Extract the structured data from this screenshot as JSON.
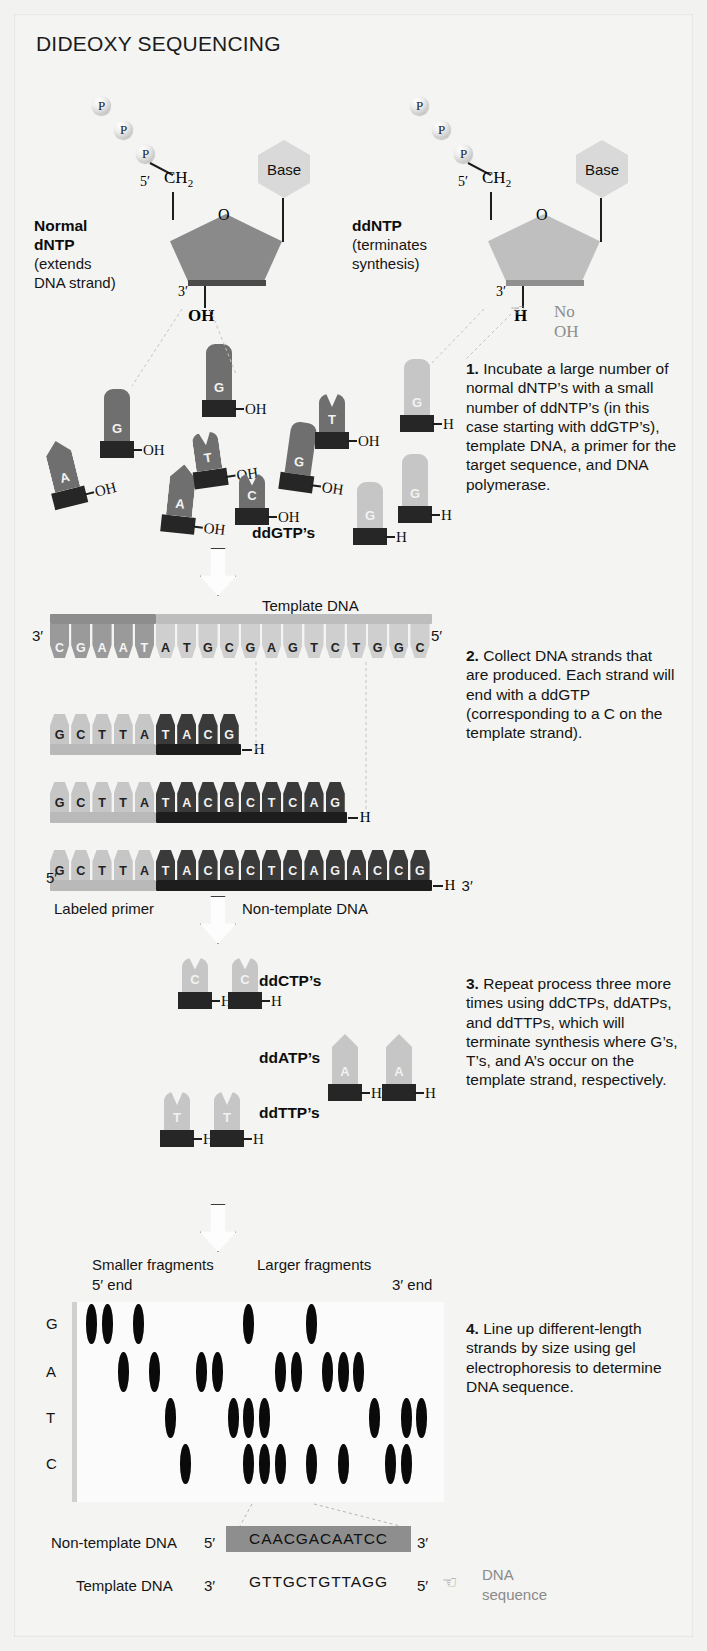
{
  "title": "DIDEOXY SEQUENCING",
  "structures": {
    "phosphate_label": "P",
    "phosphate_count": 3,
    "left": {
      "name_bold": "Normal\ndNTP",
      "name_line1": "Normal",
      "name_line2": "dNTP",
      "sub1": "(extends",
      "sub2": "DNA strand)",
      "five_prime": "5′",
      "three_prime": "3′",
      "ch2": "CH₂",
      "ring_o": "O",
      "base": "Base",
      "terminal": "OH",
      "sugar_color": "#8a8a8a"
    },
    "right": {
      "name_line1": "ddNTP",
      "sub1": "(terminates",
      "sub2": "synthesis)",
      "five_prime": "5′",
      "three_prime": "3′",
      "ch2": "CH₂",
      "ring_o": "O",
      "base": "Base",
      "terminal": "H",
      "callout": "No OH",
      "hand_icon": "pointing-hand",
      "sugar_color": "#bfbfbf"
    }
  },
  "steps": [
    {
      "num": "1.",
      "text": "Incubate a large number of normal dNTP’s with a small number of ddNTP’s (in this case starting with ddGTP’s), template DNA, a primer for the target sequence, and DNA polymerase."
    },
    {
      "num": "2.",
      "text": "Collect DNA strands that are produced. Each strand will end with a ddGTP (corresponding to a C on the template strand)."
    },
    {
      "num": "3.",
      "text": "Repeat process three more times using ddCTPs, ddATPs, and ddTTPs, which will terminate synthesis where G’s, T’s, and A’s occur on the template strand, respectively."
    },
    {
      "num": "4.",
      "text": "Line up different-length strands by size using gel electrophoresis to determine DNA sequence."
    }
  ],
  "pool": {
    "ddgtp_label": "ddGTP’s",
    "normal_nucleotides": [
      {
        "letter": "G",
        "tail": "OH",
        "x": 90,
        "y": 375,
        "rot": 0,
        "h": 52
      },
      {
        "letter": "G",
        "tail": "OH",
        "x": 192,
        "y": 330,
        "rot": 0,
        "h": 56
      },
      {
        "letter": "A",
        "tail": "OH",
        "x": 45,
        "y": 425,
        "rot": -14,
        "h": 50
      },
      {
        "letter": "A",
        "tail": "OH",
        "x": 150,
        "y": 450,
        "rot": 6,
        "h": 52
      },
      {
        "letter": "T",
        "tail": "OH",
        "x": 185,
        "y": 418,
        "rot": -8,
        "h": 38
      },
      {
        "letter": "C",
        "tail": "OH",
        "x": 225,
        "y": 460,
        "rot": 0,
        "h": 34
      },
      {
        "letter": "G",
        "tail": "OH",
        "x": 268,
        "y": 408,
        "rot": 8,
        "h": 52
      },
      {
        "letter": "T",
        "tail": "OH",
        "x": 305,
        "y": 380,
        "rot": 0,
        "h": 38
      }
    ],
    "dd_nucleotides": [
      {
        "letter": "G",
        "tail": "H",
        "x": 390,
        "y": 345,
        "h": 56
      },
      {
        "letter": "G",
        "tail": "H",
        "x": 388,
        "y": 440,
        "h": 52
      },
      {
        "letter": "G",
        "tail": "H",
        "x": 343,
        "y": 468,
        "h": 46
      }
    ]
  },
  "strands": {
    "template_label": "Template DNA",
    "template_five": "5′",
    "template_three": "3′",
    "template_sequence": "CGAATATGCGAGTCTGGC",
    "primer_label": "Labeled primer",
    "nontemplate_label": "Non-template DNA",
    "primer_length": 5,
    "products": [
      {
        "sequence": "GCTTATACG",
        "tail": "H",
        "end_label": ""
      },
      {
        "sequence": "GCTTATACGCTCAG",
        "tail": "H",
        "end_label": ""
      },
      {
        "sequence": "GCTTATACGCTCAGACCG",
        "tail": "H",
        "end_label": "3′",
        "start_label": "5′"
      }
    ]
  },
  "step3_groups": [
    {
      "label": "ddCTP’s",
      "letter": "C",
      "count": 2,
      "tail": "H"
    },
    {
      "label": "ddATP’s",
      "letter": "A",
      "count": 2,
      "tail": "H"
    },
    {
      "label": "ddTTP’s",
      "letter": "T",
      "count": 2,
      "tail": "H"
    }
  ],
  "gel": {
    "smaller_label_1": "Smaller fragments",
    "smaller_label_2": "5′ end",
    "larger_label_1": "Larger fragments",
    "larger_label_2": "3′ end",
    "lanes": [
      "G",
      "A",
      "T",
      "C"
    ],
    "read_sequence": "CAACGACAATCC",
    "bands": [
      {
        "lane": 0,
        "pos": 0
      },
      {
        "lane": 0,
        "pos": 1
      },
      {
        "lane": 0,
        "pos": 3
      },
      {
        "lane": 0,
        "pos": 10
      },
      {
        "lane": 0,
        "pos": 14
      },
      {
        "lane": 1,
        "pos": 2
      },
      {
        "lane": 1,
        "pos": 4
      },
      {
        "lane": 1,
        "pos": 7
      },
      {
        "lane": 1,
        "pos": 8
      },
      {
        "lane": 1,
        "pos": 12
      },
      {
        "lane": 1,
        "pos": 13
      },
      {
        "lane": 1,
        "pos": 15
      },
      {
        "lane": 1,
        "pos": 16
      },
      {
        "lane": 1,
        "pos": 17
      },
      {
        "lane": 2,
        "pos": 5
      },
      {
        "lane": 2,
        "pos": 9
      },
      {
        "lane": 2,
        "pos": 10
      },
      {
        "lane": 2,
        "pos": 11
      },
      {
        "lane": 2,
        "pos": 18
      },
      {
        "lane": 2,
        "pos": 20
      },
      {
        "lane": 2,
        "pos": 21
      },
      {
        "lane": 3,
        "pos": 6
      },
      {
        "lane": 3,
        "pos": 10
      },
      {
        "lane": 3,
        "pos": 11
      },
      {
        "lane": 3,
        "pos": 12
      },
      {
        "lane": 3,
        "pos": 14
      },
      {
        "lane": 3,
        "pos": 16
      },
      {
        "lane": 3,
        "pos": 19
      },
      {
        "lane": 3,
        "pos": 20
      }
    ]
  },
  "readout": {
    "nontemplate_label": "Non-template DNA",
    "nontemplate_five": "5′",
    "nontemplate_seq": "CAACGACAATCC",
    "nontemplate_three": "3′",
    "template_label": "Template DNA",
    "template_three": "3′",
    "template_seq": "GTTGCTGTTAGG",
    "template_five": "5′",
    "callout_line1": "DNA",
    "callout_line2": "sequence",
    "hand_icon": "pointing-hand"
  },
  "colors": {
    "paper": "#f4f4f2",
    "dark_nt": "#6f6f6f",
    "light_nt": "#c6c6c6",
    "primer_bar": "#b9b9b9",
    "nontemplate_bar": "#1d1d1d",
    "template_dark": "#8d8d8d",
    "template_light": "#bdbdbd"
  }
}
